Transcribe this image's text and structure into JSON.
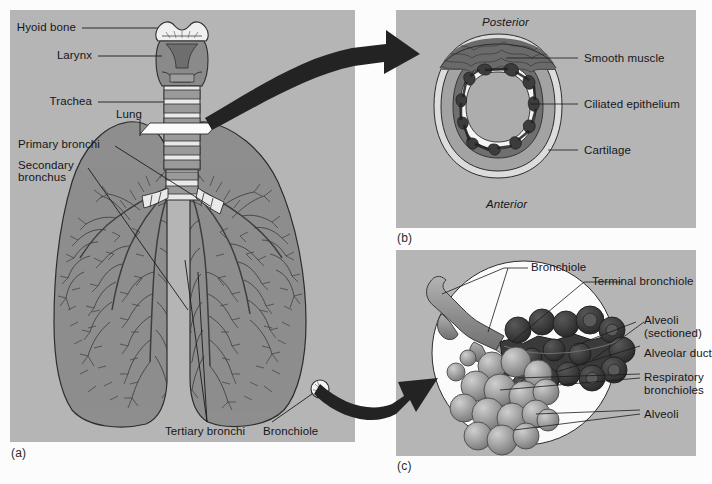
{
  "figure": {
    "background_color": "#fcfcfc",
    "panel_color": "#b5b5b5"
  },
  "panel_a": {
    "caption": "(a)",
    "labels": [
      {
        "id": "hyoid-bone",
        "text": "Hyoid bone"
      },
      {
        "id": "larynx",
        "text": "Larynx"
      },
      {
        "id": "trachea",
        "text": "Trachea"
      },
      {
        "id": "lung",
        "text": "Lung"
      },
      {
        "id": "primary-bronchi",
        "text": "Primary bronchi"
      },
      {
        "id": "secondary-bronchus-line1",
        "text": "Secondary"
      },
      {
        "id": "secondary-bronchus-line2",
        "text": "bronchus"
      },
      {
        "id": "tertiary-bronchi",
        "text": "Tertiary bronchi"
      },
      {
        "id": "bronchiole",
        "text": "Bronchiole"
      }
    ],
    "colors": {
      "lung_fill": "#8e8e8e",
      "lung_outline": "#2f2f2f",
      "cartilage_light": "#e8e8e8",
      "trachea_band": "#9a9a9a",
      "larynx_fill": "#8a8a8a"
    }
  },
  "panel_b": {
    "caption": "(b)",
    "orientation": {
      "top": "Posterior",
      "bottom": "Anterior"
    },
    "labels": [
      {
        "id": "smooth-muscle",
        "text": "Smooth muscle"
      },
      {
        "id": "ciliated-epithelium",
        "text": "Ciliated epithelium"
      },
      {
        "id": "cartilage",
        "text": "Cartilage"
      }
    ],
    "colors": {
      "cartilage_ring": "#a0a0a0",
      "outer_rim": "#d8d8d8",
      "submucosa": "#6f6f6f",
      "epithelium": "#f2f2f2",
      "lumen": "#adadad",
      "muscle_band": "#5c5c5c"
    }
  },
  "panel_c": {
    "caption": "(c)",
    "labels": [
      {
        "id": "bronchiole",
        "text": "Bronchiole"
      },
      {
        "id": "terminal-bronchiole",
        "text": "Terminal bronchiole"
      },
      {
        "id": "alveoli-sectioned-l1",
        "text": "Alveoli"
      },
      {
        "id": "alveoli-sectioned-l2",
        "text": "(sectioned)"
      },
      {
        "id": "alveolar-duct",
        "text": "Alveolar duct"
      },
      {
        "id": "respiratory-bronchioles-l1",
        "text": "Respiratory"
      },
      {
        "id": "respiratory-bronchioles-l2",
        "text": "bronchioles"
      },
      {
        "id": "alveoli",
        "text": "Alveoli"
      }
    ],
    "colors": {
      "circle_bg": "#fbfbfb",
      "bronchiole_tube": "#8f8f8f",
      "sectioned_alveoli": "#3c3c3c",
      "alveoli_cluster": "#9c9c9c"
    }
  }
}
